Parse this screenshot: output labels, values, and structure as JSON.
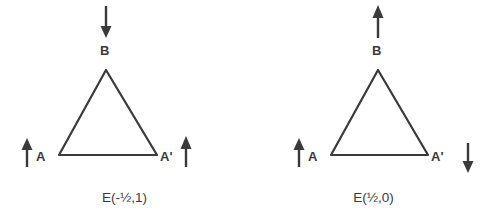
{
  "figure": {
    "background_color": "#ffffff",
    "stroke_color": "#3a3a3a",
    "panels": [
      {
        "id": "left",
        "caption": "E(-½,1)",
        "caption_x": 0,
        "caption_y": 191,
        "triangle": {
          "apex": {
            "x": 106,
            "y": 70
          },
          "base_left": {
            "x": 59,
            "y": 155
          },
          "base_right": {
            "x": 157,
            "y": 155
          }
        },
        "vertices": [
          {
            "name": "B",
            "label": "B",
            "x": 100,
            "y": 44
          },
          {
            "name": "A",
            "label": "A",
            "x": 36,
            "y": 150
          },
          {
            "name": "Ap",
            "label": "A'",
            "x": 160,
            "y": 150
          }
        ],
        "arrows": [
          {
            "name": "arrow-b",
            "direction": "down",
            "x": 106,
            "y_top": 6,
            "y_bottom": 37
          },
          {
            "name": "arrow-a",
            "direction": "up",
            "x": 27,
            "y_top": 139,
            "y_bottom": 167
          },
          {
            "name": "arrow-aprime",
            "direction": "up",
            "x": 186,
            "y_top": 137,
            "y_bottom": 167
          }
        ]
      },
      {
        "id": "right",
        "caption": "E(½,0)",
        "caption_x": 249,
        "caption_y": 191,
        "triangle": {
          "apex": {
            "x": 129,
            "y": 70
          },
          "base_left": {
            "x": 82,
            "y": 155
          },
          "base_right": {
            "x": 179,
            "y": 155
          }
        },
        "vertices": [
          {
            "name": "B",
            "label": "B",
            "x": 123,
            "y": 44
          },
          {
            "name": "A",
            "label": "A",
            "x": 59,
            "y": 150
          },
          {
            "name": "Ap",
            "label": "A'",
            "x": 182,
            "y": 150
          }
        ],
        "arrows": [
          {
            "name": "arrow-b",
            "direction": "up",
            "x": 129,
            "y_top": 6,
            "y_bottom": 37
          },
          {
            "name": "arrow-a",
            "direction": "up",
            "x": 50,
            "y_top": 139,
            "y_bottom": 167
          },
          {
            "name": "arrow-aprime",
            "direction": "down",
            "x": 219,
            "y_top": 143,
            "y_bottom": 173
          }
        ]
      }
    ]
  }
}
